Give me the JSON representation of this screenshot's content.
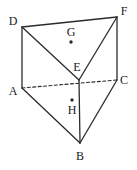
{
  "figure": {
    "kind": "triangular-prism-diagram",
    "width": 137,
    "height": 170,
    "background_color": "#ffffff",
    "stroke_color": "#2b2b2b",
    "label_color": "#1b1b1b",
    "solid_stroke_width": 1.3,
    "dashed_stroke_width": 1.1,
    "dash_pattern": "3,2.4"
  },
  "vertices": [
    {
      "id": "D",
      "label": "D",
      "x": 22,
      "y": 27,
      "label_x": 13,
      "label_y": 21
    },
    {
      "id": "F",
      "label": "F",
      "x": 117,
      "y": 17,
      "label_x": 124,
      "label_y": 11
    },
    {
      "id": "E",
      "label": "E",
      "x": 79,
      "y": 80,
      "label_x": 77,
      "label_y": 67
    },
    {
      "id": "A",
      "label": "A",
      "x": 22,
      "y": 88,
      "label_x": 13,
      "label_y": 91
    },
    {
      "id": "C",
      "label": "C",
      "x": 117,
      "y": 80,
      "label_x": 124,
      "label_y": 80
    },
    {
      "id": "B",
      "label": "B",
      "x": 80,
      "y": 143,
      "label_x": 80,
      "label_y": 156
    }
  ],
  "interior_points": [
    {
      "id": "G",
      "label": "G",
      "x": 71,
      "y": 42,
      "label_x": 71,
      "label_y": 32,
      "radius": 1.7
    },
    {
      "id": "H",
      "label": "H",
      "x": 72,
      "y": 100,
      "label_x": 72,
      "label_y": 110,
      "radius": 1.7
    }
  ],
  "edges": [
    {
      "id": "DF",
      "from": "D",
      "to": "F",
      "style": "solid",
      "x1": 22,
      "y1": 27,
      "x2": 117,
      "y2": 17
    },
    {
      "id": "DE",
      "from": "D",
      "to": "E",
      "style": "solid",
      "x1": 22,
      "y1": 27,
      "x2": 79,
      "y2": 80
    },
    {
      "id": "EF",
      "from": "E",
      "to": "F",
      "style": "solid",
      "x1": 79,
      "y1": 80,
      "x2": 117,
      "y2": 17
    },
    {
      "id": "DA",
      "from": "D",
      "to": "A",
      "style": "solid",
      "x1": 22,
      "y1": 27,
      "x2": 22,
      "y2": 88
    },
    {
      "id": "FC",
      "from": "F",
      "to": "C",
      "style": "solid",
      "x1": 117,
      "y1": 17,
      "x2": 117,
      "y2": 80
    },
    {
      "id": "EB",
      "from": "E",
      "to": "B",
      "style": "solid",
      "x1": 79,
      "y1": 80,
      "x2": 80,
      "y2": 143
    },
    {
      "id": "AB",
      "from": "A",
      "to": "B",
      "style": "solid",
      "x1": 22,
      "y1": 88,
      "x2": 80,
      "y2": 143
    },
    {
      "id": "BC",
      "from": "B",
      "to": "C",
      "style": "solid",
      "x1": 80,
      "y1": 143,
      "x2": 117,
      "y2": 80
    },
    {
      "id": "AC",
      "from": "A",
      "to": "C",
      "style": "dashed",
      "x1": 22,
      "y1": 88,
      "x2": 117,
      "y2": 80
    }
  ]
}
